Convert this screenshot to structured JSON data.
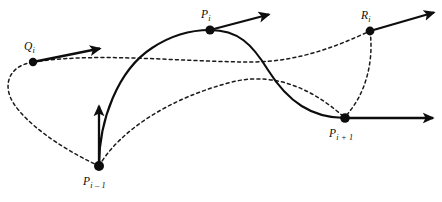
{
  "figure": {
    "type": "spline-tangent-diagram",
    "background_color": "#ffffff",
    "stroke_color": "#0d0d0d",
    "width": 442,
    "height": 202
  },
  "labels": {
    "q_i": "Q",
    "q_i_sub": "i",
    "p_i": "P",
    "p_i_sub": "i",
    "r_i": "R",
    "r_i_sub": "i",
    "p_i_minus_1": "P",
    "p_i_minus_1_sub": "i – 1",
    "p_i_plus_1": "P",
    "p_i_plus_1_sub": "i + 1"
  },
  "points": [
    {
      "name": "Q_i",
      "x": 33,
      "y": 62,
      "radius": 4.2
    },
    {
      "name": "P_i",
      "x": 210,
      "y": 30,
      "radius": 4.6
    },
    {
      "name": "R_i",
      "x": 370,
      "y": 31,
      "radius": 4.4
    },
    {
      "name": "P_i-1",
      "x": 99,
      "y": 166,
      "radius": 5.0
    },
    {
      "name": "P_i+1",
      "x": 345,
      "y": 118,
      "radius": 4.8
    }
  ],
  "tangent_vectors": [
    {
      "name": "tangent-at-q-i",
      "x1": 33,
      "y1": 62,
      "x2": 103,
      "y2": 48,
      "direction": "right-up"
    },
    {
      "name": "tangent-at-p-i",
      "x1": 210,
      "y1": 30,
      "x2": 272,
      "y2": 14,
      "direction": "right-up"
    },
    {
      "name": "tangent-at-r-i",
      "x1": 370,
      "y1": 31,
      "x2": 437,
      "y2": 12,
      "direction": "right-up"
    },
    {
      "name": "tangent-at-p-i-minus-1",
      "x1": 99,
      "y1": 166,
      "x2": 99,
      "y2": 103,
      "direction": "up"
    },
    {
      "name": "tangent-at-p-i-plus-1",
      "x1": 345,
      "y1": 118,
      "x2": 437,
      "y2": 118,
      "direction": "right"
    }
  ],
  "curves": {
    "solid_spline": {
      "name": "solid-interpolating-spline",
      "style": "solid",
      "description": "S-shaped curve through P_i-1, P_i, P_i+1"
    },
    "dashed_curves": [
      {
        "name": "dashed-loop-q-to-p-i-minus-1",
        "style": "dashed"
      },
      {
        "name": "dashed-arc-q-to-r",
        "style": "dashed"
      },
      {
        "name": "dashed-arc-p-i-minus-1-to-p-i-plus-1",
        "style": "dashed"
      },
      {
        "name": "dashed-arc-r-to-p-i-plus-1",
        "style": "dashed"
      }
    ]
  }
}
